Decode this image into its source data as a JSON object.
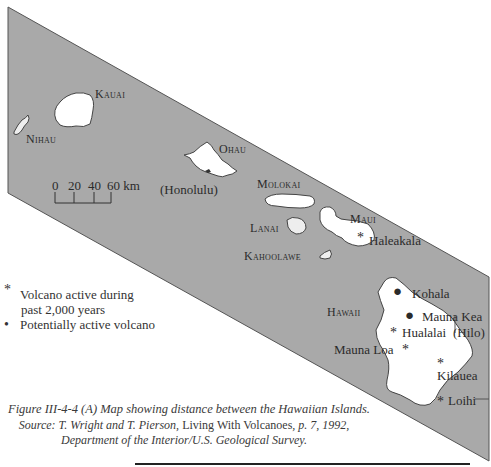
{
  "map": {
    "background_color": "#a9a9a9",
    "land_color": "#ffffff",
    "islands": [
      {
        "name": "Kauai"
      },
      {
        "name": "Nihau"
      },
      {
        "name": "Ohau"
      },
      {
        "name": "Molokai"
      },
      {
        "name": "Lanai"
      },
      {
        "name": "Maui"
      },
      {
        "name": "Kahoolawe"
      },
      {
        "name": "Hawaii"
      }
    ],
    "labels": {
      "kauai": "Kauai",
      "nihau": "Nihau",
      "ohau": "Ohau",
      "honolulu": "(Honolulu)",
      "molokai": "Molokai",
      "lanai": "Lanai",
      "maui": "Maui",
      "haleakala": "Haleakala",
      "kahoolawe": "Kahoolawe",
      "hawaii": "Hawaii",
      "kohala": "Kohala",
      "mauna_kea": "Mauna Kea",
      "hualalai": "Hualalai",
      "hilo": "(Hilo)",
      "mauna_loa": "Mauna Loa",
      "kilauea": "Kilauea",
      "loihi": "Loihi"
    },
    "volcanoes": [
      {
        "name": "Haleakala",
        "type": "active"
      },
      {
        "name": "Kohala",
        "type": "potentially-active"
      },
      {
        "name": "Mauna Kea",
        "type": "potentially-active"
      },
      {
        "name": "Hualalai",
        "type": "active"
      },
      {
        "name": "Mauna Loa",
        "type": "active"
      },
      {
        "name": "Kilauea",
        "type": "active"
      },
      {
        "name": "Loihi",
        "type": "active"
      }
    ],
    "scale_bar": {
      "ticks": [
        "0",
        "20",
        "40",
        "60 km"
      ],
      "unit": "km"
    }
  },
  "legend": {
    "active_symbol": "*",
    "active_label_line1": "Volcano active during",
    "active_label_line2": "past 2,000 years",
    "potential_symbol": "•",
    "potential_label": "Potentially active volcano"
  },
  "caption": {
    "title": "Figure III-4-4  (A) Map showing distance between the Hawaiian Islands.",
    "source_prefix": "Source: T. Wright and T. Pierson, ",
    "source_book": "Living With Volcanoes",
    "source_suffix": ", p. 7, 1992,",
    "source_line3": "Department of the Interior/U.S. Geological Survey."
  }
}
